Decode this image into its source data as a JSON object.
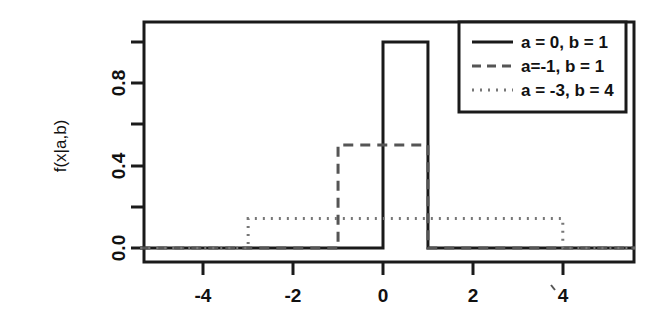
{
  "chart_data": {
    "type": "line",
    "title": "",
    "xlabel": "",
    "ylabel": "f(x|a,b)",
    "xlim": [
      -5.4,
      5.6
    ],
    "ylim": [
      -0.03,
      1.08
    ],
    "xticks": [
      -4,
      -2,
      0,
      2,
      4
    ],
    "xtick_labels": [
      "-4",
      "-2",
      "0",
      "2",
      "4"
    ],
    "yticks": [
      0.0,
      0.2,
      0.4,
      0.6,
      0.8,
      1.0
    ],
    "ytick_labels": [
      "0.0",
      "",
      "0.4",
      "",
      "0.8",
      ""
    ],
    "grid": false,
    "legend_position": "top-right",
    "series": [
      {
        "name": "a = 0, b = 1",
        "style": "solid",
        "a": 0,
        "b": 1,
        "height": 1.0,
        "color": "#1a1a1a",
        "x": [
          -5.4,
          0,
          0,
          1,
          1,
          5.6
        ],
        "y": [
          0,
          0,
          1.0,
          1.0,
          0,
          0
        ]
      },
      {
        "name": "a=-1, b = 1",
        "style": "dashed",
        "a": -1,
        "b": 1,
        "height": 0.5,
        "color": "#555555",
        "x": [
          -5.4,
          -1,
          -1,
          1,
          1,
          5.6
        ],
        "y": [
          0,
          0,
          0.5,
          0.5,
          0,
          0
        ]
      },
      {
        "name": "a = -3, b = 4",
        "style": "dotted",
        "a": -3,
        "b": 4,
        "height": 0.1428,
        "color": "#777777",
        "x": [
          -5.4,
          -3,
          -3,
          4,
          4,
          5.6
        ],
        "y": [
          0,
          0,
          0.1428,
          0.1428,
          0,
          0
        ]
      }
    ]
  },
  "axes": {
    "y_axis_label": "f(x|a,b)",
    "x_tick_0": "-4",
    "x_tick_1": "-2",
    "x_tick_2": "0",
    "x_tick_3": "2",
    "x_tick_4": "4",
    "y_tick_0": "0.0",
    "y_tick_1": "0.4",
    "y_tick_2": "0.8"
  },
  "legend": {
    "entries": [
      {
        "label": "a = 0, b = 1",
        "style": "solid"
      },
      {
        "label": "a=-1, b = 1",
        "style": "dashed"
      },
      {
        "label": "a = -3, b = 4",
        "style": "dotted"
      }
    ]
  }
}
